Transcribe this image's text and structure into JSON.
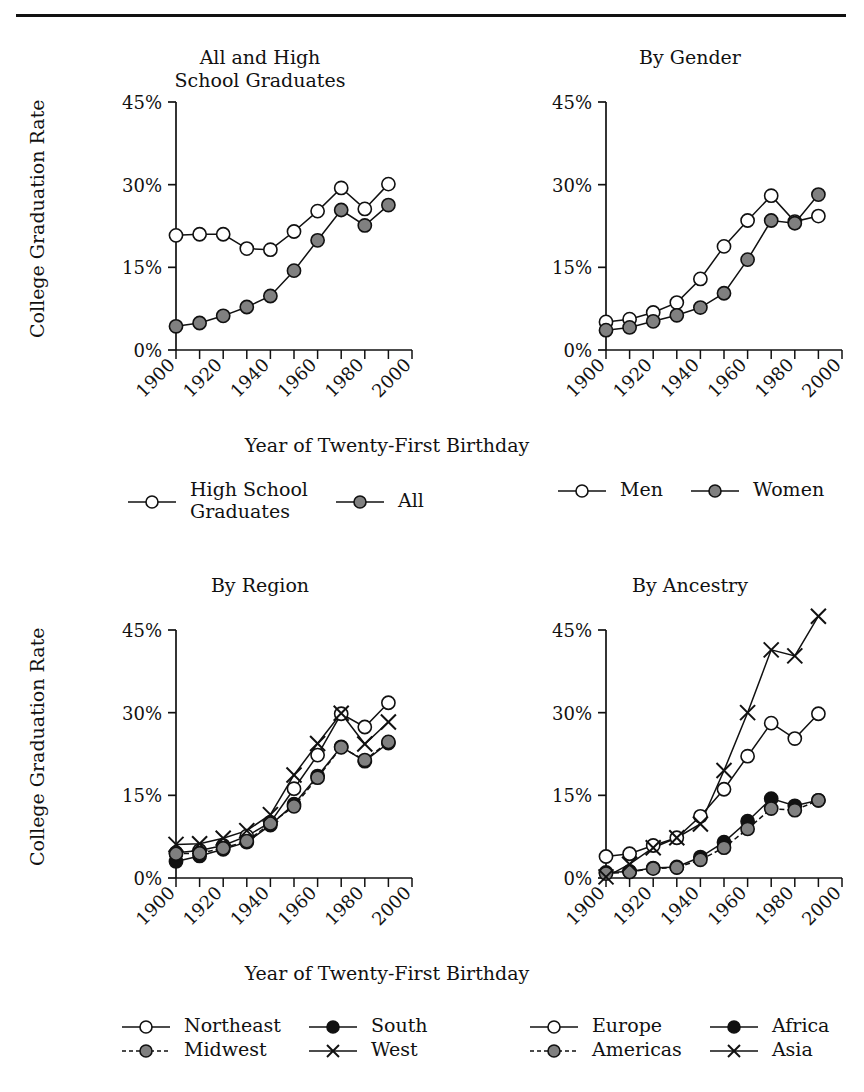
{
  "figure": {
    "y_axis_label": "College Graduation Rate",
    "x_axis_label": "Year of Twenty-First Birthday",
    "y_ticks": [
      "0%",
      "15%",
      "30%",
      "45%"
    ],
    "x_ticks": [
      "1900",
      "1920",
      "1940",
      "1960",
      "1980",
      "2000"
    ]
  },
  "panels": {
    "p1": {
      "title_line1": "All and High",
      "title_line2": "School Graduates"
    },
    "p2": {
      "title_line1": "By Gender",
      "title_line2": ""
    },
    "p3": {
      "title_line1": "By Region",
      "title_line2": ""
    },
    "p4": {
      "title_line1": "By Ancestry",
      "title_line2": ""
    }
  },
  "legends": {
    "l1": [
      {
        "label": "High School",
        "label2": "Graduates",
        "marker": "open-circle",
        "line": "solid"
      },
      {
        "label": "All",
        "label2": "",
        "marker": "gray-circle",
        "line": "solid"
      }
    ],
    "l2": [
      {
        "label": "Men",
        "marker": "open-circle",
        "line": "solid"
      },
      {
        "label": "Women",
        "marker": "gray-circle",
        "line": "solid"
      }
    ],
    "l3": [
      {
        "label": "Northeast",
        "marker": "open-circle",
        "line": "solid"
      },
      {
        "label": "South",
        "marker": "black-circle",
        "line": "solid"
      },
      {
        "label": "Midwest",
        "marker": "gray-circle",
        "line": "dashed"
      },
      {
        "label": "West",
        "marker": "cross",
        "line": "solid"
      }
    ],
    "l4": [
      {
        "label": "Europe",
        "marker": "open-circle",
        "line": "solid"
      },
      {
        "label": "Africa",
        "marker": "black-circle",
        "line": "solid"
      },
      {
        "label": "Americas",
        "marker": "gray-circle",
        "line": "dashed"
      },
      {
        "label": "Asia",
        "marker": "cross",
        "line": "solid"
      }
    ]
  },
  "colors": {
    "ink": "#111111",
    "gray_marker": "#808080",
    "black_marker": "#111111",
    "open_marker": "#ffffff"
  },
  "chart_data": [
    {
      "type": "line",
      "title": "All and High School Graduates",
      "xlabel": "Year of Twenty-First Birthday",
      "ylabel": "College Graduation Rate",
      "xlim": [
        1900,
        2000
      ],
      "ylim": [
        0,
        45
      ],
      "grid": false,
      "legend_position": "below",
      "x": [
        1900,
        1910,
        1920,
        1930,
        1940,
        1950,
        1960,
        1970,
        1980,
        1990
      ],
      "series": [
        {
          "name": "High School Graduates",
          "marker": "open-circle",
          "line": "solid",
          "values": [
            20.8,
            21.0,
            21.0,
            18.4,
            18.2,
            21.5,
            25.2,
            29.4,
            25.6,
            30.1
          ]
        },
        {
          "name": "All",
          "marker": "gray-circle",
          "line": "solid",
          "values": [
            4.3,
            4.9,
            6.2,
            7.8,
            9.8,
            14.4,
            19.9,
            25.4,
            22.6,
            26.3
          ]
        }
      ]
    },
    {
      "type": "line",
      "title": "By Gender",
      "xlabel": "Year of Twenty-First Birthday",
      "ylabel": "College Graduation Rate",
      "xlim": [
        1900,
        2000
      ],
      "ylim": [
        0,
        45
      ],
      "grid": false,
      "legend_position": "below",
      "x": [
        1900,
        1910,
        1920,
        1930,
        1940,
        1950,
        1960,
        1970,
        1980,
        1990
      ],
      "series": [
        {
          "name": "Men",
          "marker": "open-circle",
          "line": "solid",
          "values": [
            5.1,
            5.6,
            6.8,
            8.6,
            12.9,
            18.8,
            23.5,
            28.0,
            23.3,
            24.3
          ]
        },
        {
          "name": "Women",
          "marker": "gray-circle",
          "line": "solid",
          "values": [
            3.6,
            4.1,
            5.2,
            6.3,
            7.7,
            10.3,
            16.4,
            23.5,
            23.0,
            28.2
          ]
        }
      ]
    },
    {
      "type": "line",
      "title": "By Region",
      "xlabel": "Year of Twenty-First Birthday",
      "ylabel": "College Graduation Rate",
      "xlim": [
        1900,
        2000
      ],
      "ylim": [
        0,
        45
      ],
      "grid": false,
      "legend_position": "below",
      "x": [
        1900,
        1910,
        1920,
        1930,
        1940,
        1950,
        1960,
        1970,
        1980,
        1990
      ],
      "series": [
        {
          "name": "Northeast",
          "marker": "open-circle",
          "line": "solid",
          "values": [
            4.6,
            5.0,
            5.9,
            7.6,
            10.1,
            16.2,
            22.3,
            29.8,
            27.4,
            31.8
          ]
        },
        {
          "name": "South",
          "marker": "black-circle",
          "line": "solid",
          "values": [
            3.0,
            4.0,
            5.2,
            6.5,
            9.6,
            13.4,
            18.5,
            23.8,
            21.2,
            24.5
          ]
        },
        {
          "name": "Midwest",
          "marker": "gray-circle",
          "line": "dashed",
          "values": [
            4.4,
            4.5,
            5.4,
            6.7,
            9.9,
            13.0,
            18.2,
            23.7,
            21.4,
            24.7
          ]
        },
        {
          "name": "West",
          "marker": "cross",
          "line": "solid",
          "values": [
            6.1,
            6.2,
            7.2,
            8.6,
            11.5,
            18.7,
            24.4,
            29.9,
            24.3,
            28.3
          ]
        }
      ]
    },
    {
      "type": "line",
      "title": "By Ancestry",
      "xlabel": "Year of Twenty-First Birthday",
      "ylabel": "College Graduation Rate",
      "xlim": [
        1900,
        2000
      ],
      "ylim": [
        0,
        45
      ],
      "grid": false,
      "legend_position": "below",
      "x": [
        1900,
        1910,
        1920,
        1930,
        1940,
        1950,
        1960,
        1970,
        1980,
        1990
      ],
      "series": [
        {
          "name": "Europe",
          "marker": "open-circle",
          "line": "solid",
          "values": [
            3.9,
            4.4,
            5.9,
            7.3,
            11.2,
            16.1,
            22.1,
            28.1,
            25.3,
            29.8
          ]
        },
        {
          "name": "Africa",
          "marker": "black-circle",
          "line": "solid",
          "values": [
            1.0,
            1.2,
            1.8,
            2.0,
            3.8,
            6.5,
            10.3,
            14.4,
            13.1,
            14.1
          ]
        },
        {
          "name": "Americas",
          "marker": "gray-circle",
          "line": "dashed",
          "values": [
            0.8,
            1.1,
            1.7,
            1.9,
            3.3,
            5.5,
            8.9,
            12.6,
            12.3,
            14.1
          ]
        },
        {
          "name": "Asia",
          "marker": "cross",
          "line": "solid",
          "values": [
            0.2,
            2.5,
            5.5,
            7.3,
            9.8,
            19.5,
            30.0,
            41.4,
            40.3,
            47.5
          ]
        }
      ]
    }
  ]
}
